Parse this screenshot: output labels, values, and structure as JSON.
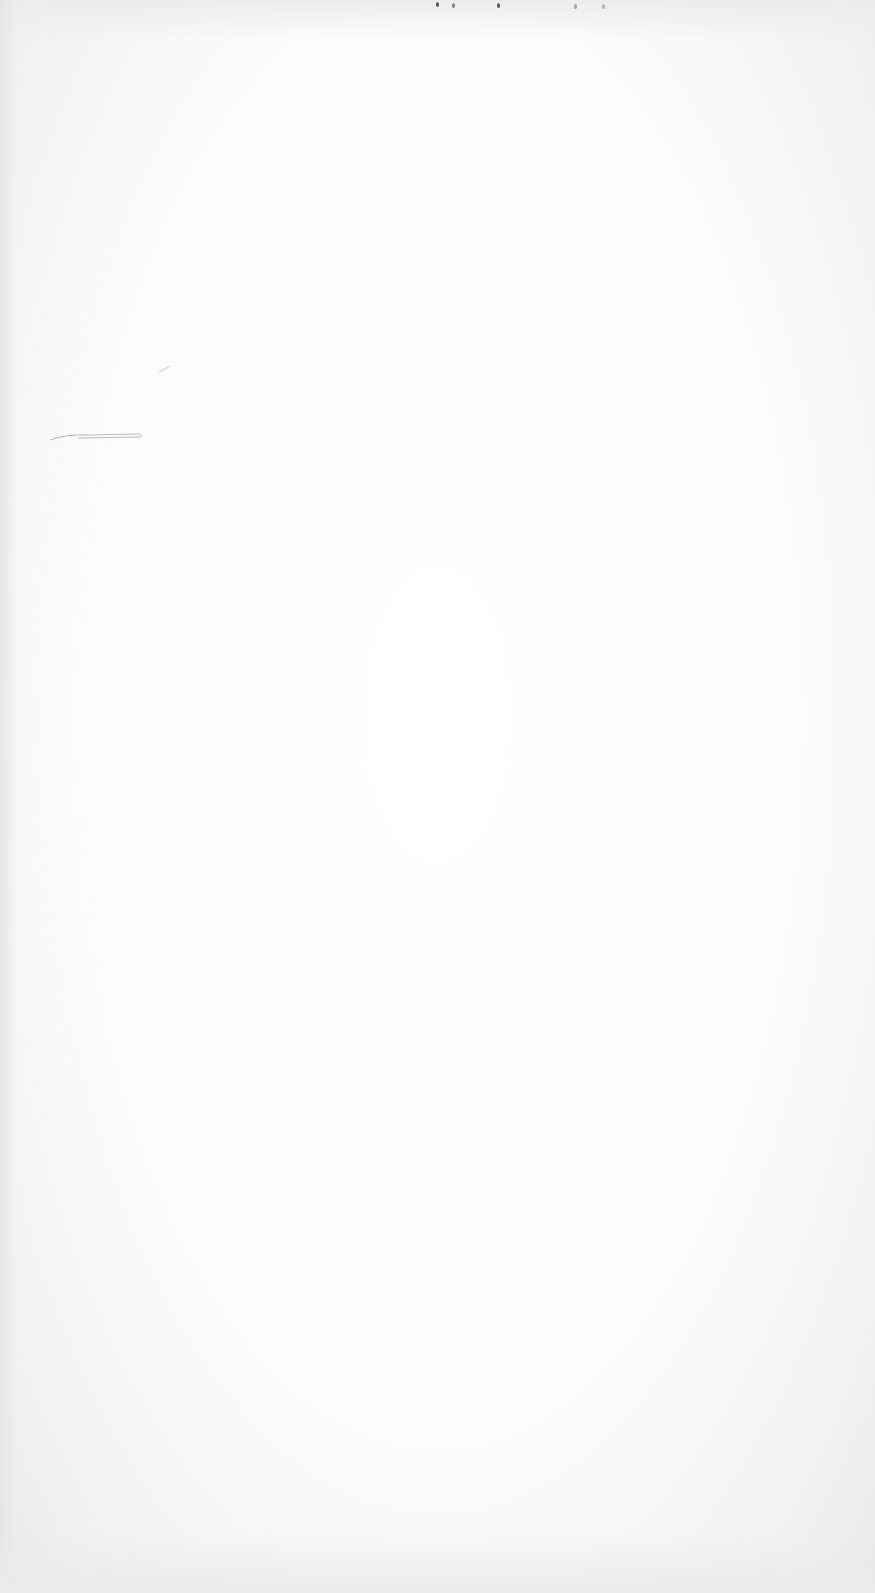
{
  "page": {
    "type": "blank-scanned-page",
    "background_color": "#ffffff",
    "text": ""
  },
  "marks": {
    "top_specks": [
      {
        "x": 436,
        "y": 4
      },
      {
        "x": 452,
        "y": 5
      },
      {
        "x": 497,
        "y": 5
      },
      {
        "x": 574,
        "y": 6
      },
      {
        "x": 602,
        "y": 6
      }
    ],
    "pen_stroke": {
      "x": 48,
      "y": 430,
      "width": 96
    }
  }
}
